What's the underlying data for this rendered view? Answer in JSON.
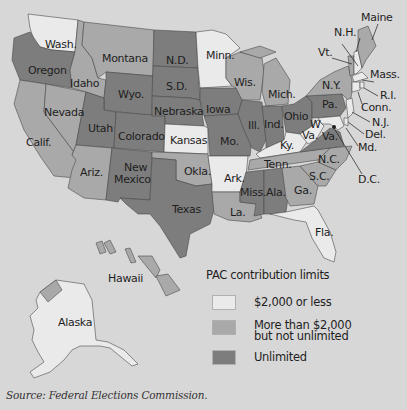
{
  "colors": {
    "background": "#d8d7d7",
    "le_2000": "#ebeaea",
    "gt_2000_limited": "#a9a9a9",
    "unlimited": "#7d7d7d"
  },
  "legend": {
    "title": "PAC contribution limits",
    "items": [
      {
        "label_line1": "$2,000 or less",
        "label_line2": "",
        "category": "le_2000"
      },
      {
        "label_line1": "More than $2,000",
        "label_line2": "but not unlimited",
        "category": "gt_2000_limited"
      },
      {
        "label_line1": "Unlimited",
        "label_line2": "",
        "category": "unlimited"
      }
    ]
  },
  "source": "Source: Federal Elections Commission.",
  "states": {
    "wash": {
      "label": "Wash.",
      "category": "le_2000"
    },
    "oregon": {
      "label": "Oregon",
      "category": "unlimited"
    },
    "calif": {
      "label": "Calif.",
      "category": "gt_2000_limited"
    },
    "nevada": {
      "label": "Nevada",
      "category": "gt_2000_limited"
    },
    "idaho": {
      "label": "Idaho",
      "category": "gt_2000_limited"
    },
    "montana": {
      "label": "Montana",
      "category": "gt_2000_limited"
    },
    "wyo": {
      "label": "Wyo.",
      "category": "unlimited"
    },
    "utah": {
      "label": "Utah",
      "category": "unlimited"
    },
    "ariz": {
      "label": "Ariz.",
      "category": "gt_2000_limited"
    },
    "colorado": {
      "label": "Colorado",
      "category": "unlimited"
    },
    "new_mexico": {
      "label": "New\nMexico",
      "label_line1": "New",
      "label_line2": "Mexico",
      "category": "unlimited"
    },
    "nd": {
      "label": "N.D.",
      "category": "unlimited"
    },
    "sd": {
      "label": "S.D.",
      "category": "unlimited"
    },
    "nebraska": {
      "label": "Nebraska",
      "category": "unlimited"
    },
    "kansas": {
      "label": "Kansas",
      "category": "le_2000"
    },
    "okla": {
      "label": "Okla.",
      "category": "gt_2000_limited"
    },
    "texas": {
      "label": "Texas",
      "category": "unlimited"
    },
    "minn": {
      "label": "Minn.",
      "category": "le_2000"
    },
    "iowa": {
      "label": "Iowa",
      "category": "unlimited"
    },
    "mo": {
      "label": "Mo.",
      "category": "unlimited"
    },
    "ark": {
      "label": "Ark.",
      "category": "le_2000"
    },
    "la": {
      "label": "La.",
      "category": "gt_2000_limited"
    },
    "wis": {
      "label": "Wis.",
      "category": "gt_2000_limited"
    },
    "ill": {
      "label": "Ill.",
      "category": "unlimited"
    },
    "mich": {
      "label": "Mich.",
      "category": "gt_2000_limited"
    },
    "ind": {
      "label": "Ind.",
      "category": "unlimited"
    },
    "ohio": {
      "label": "Ohio",
      "category": "unlimited"
    },
    "ky": {
      "label": "Ky.",
      "category": "le_2000"
    },
    "tenn": {
      "label": "Tenn.",
      "category": "gt_2000_limited"
    },
    "miss": {
      "label": "Miss.",
      "category": "unlimited"
    },
    "ala": {
      "label": "Ala.",
      "category": "unlimited"
    },
    "ga": {
      "label": "Ga.",
      "category": "gt_2000_limited"
    },
    "fla": {
      "label": "Fla.",
      "category": "le_2000"
    },
    "sc": {
      "label": "S.C.",
      "category": "gt_2000_limited"
    },
    "nc": {
      "label": "N.C.",
      "category": "gt_2000_limited"
    },
    "va": {
      "label": "Va.",
      "category": "unlimited"
    },
    "wva": {
      "label_line1": "W",
      "label_line2": "Va.",
      "category": "le_2000"
    },
    "pa": {
      "label": "Pa.",
      "category": "unlimited"
    },
    "ny": {
      "label": "N.Y.",
      "category": "gt_2000_limited"
    },
    "vt": {
      "label": "Vt.",
      "category": "gt_2000_limited"
    },
    "nh": {
      "label": "N.H.",
      "category": "le_2000"
    },
    "maine": {
      "label": "Maine",
      "category": "gt_2000_limited"
    },
    "mass": {
      "label": "Mass.",
      "category": "le_2000"
    },
    "ri": {
      "label": "R.I.",
      "category": "le_2000"
    },
    "conn": {
      "label": "Conn.",
      "category": "le_2000"
    },
    "nj": {
      "label": "N.J.",
      "category": "le_2000"
    },
    "del": {
      "label": "Del.",
      "category": "le_2000"
    },
    "md": {
      "label": "Md.",
      "category": "le_2000"
    },
    "dc": {
      "label": "D.C.",
      "category": "le_2000"
    },
    "hawaii": {
      "label": "Hawaii",
      "category": "gt_2000_limited"
    },
    "alaska": {
      "label": "Alaska",
      "category": "le_2000"
    }
  }
}
